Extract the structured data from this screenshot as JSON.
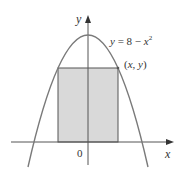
{
  "figure": {
    "equation_label": "y = 8 − x²",
    "equation_parts": {
      "lhs": "y",
      "eq": " = 8 − ",
      "var": "x",
      "exp": "2"
    },
    "point_label": "(x, y)",
    "point_parts": {
      "open": "(",
      "x": "x",
      "comma": ", ",
      "y": "y",
      "close": ")"
    },
    "origin_label": "0",
    "x_axis_label": "x",
    "y_axis_label": "y",
    "colors": {
      "curve": "#7a7a7a",
      "axes": "#555555",
      "rect_fill": "#d9d9d9",
      "rect_stroke": "#555555"
    }
  }
}
